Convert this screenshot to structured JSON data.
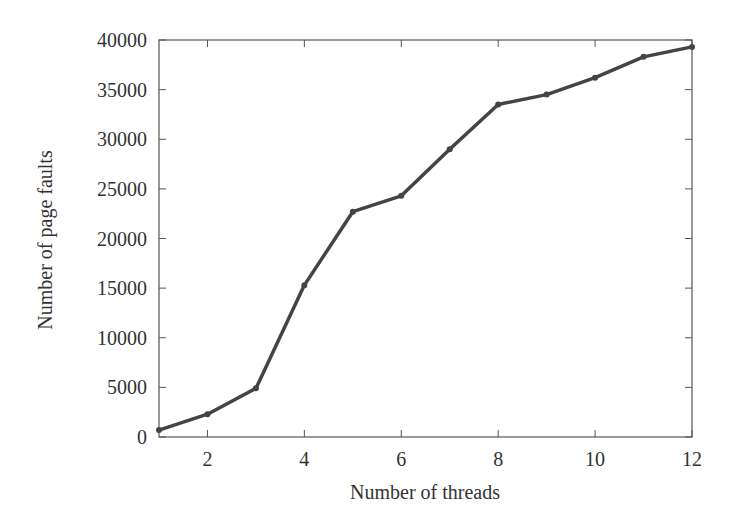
{
  "chart_data": {
    "type": "line",
    "title": "",
    "xlabel": "Number of threads",
    "ylabel": "Number of page faults",
    "xlim": [
      1,
      12
    ],
    "ylim": [
      0,
      40000
    ],
    "x_ticks": [
      2,
      4,
      6,
      8,
      10,
      12
    ],
    "y_ticks": [
      0,
      5000,
      10000,
      15000,
      20000,
      25000,
      30000,
      35000,
      40000
    ],
    "grid": false,
    "legend": null,
    "series": [
      {
        "name": "page faults",
        "color": "#444444",
        "x": [
          1,
          2,
          3,
          4,
          5,
          6,
          7,
          8,
          9,
          10,
          11,
          12
        ],
        "values": [
          700,
          2300,
          4900,
          15300,
          22700,
          24300,
          29000,
          33500,
          34500,
          36200,
          38300,
          39300
        ]
      }
    ]
  }
}
